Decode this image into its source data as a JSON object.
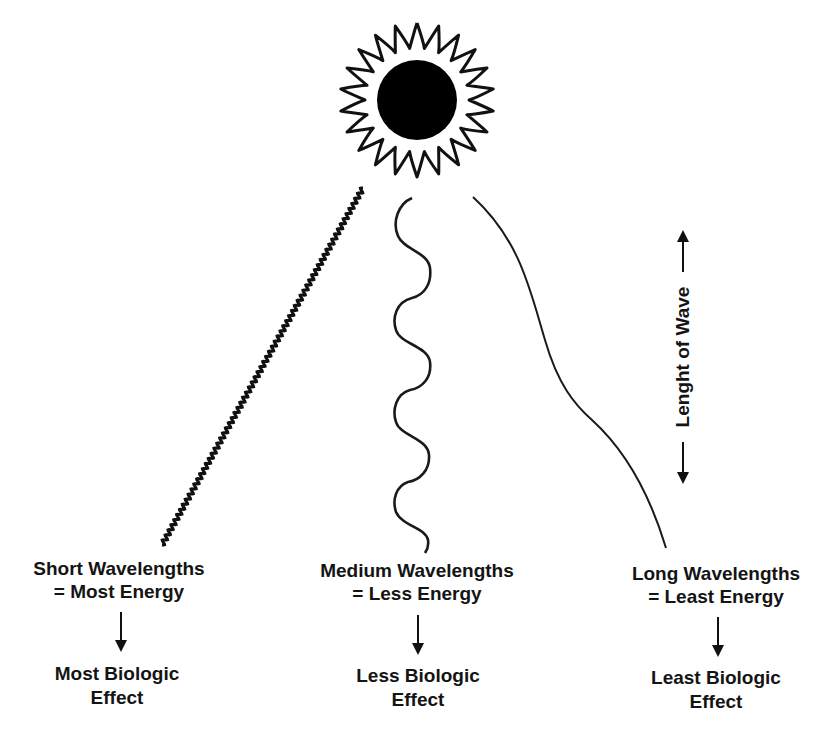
{
  "diagram": {
    "title": "",
    "sun": {
      "icon": "sun-icon",
      "disc_color": "#000000",
      "ray_style": "wavy-outline"
    },
    "axis": {
      "label": "Lenght of Wave",
      "arrow": "double-vertical-arrow"
    },
    "columns": [
      {
        "id": "short",
        "wave_type": "short-wavelength-wave",
        "line1": "Short Wavelengths",
        "line2": "= Most Energy",
        "effect_line1": "Most Biologic",
        "effect_line2": "Effect"
      },
      {
        "id": "medium",
        "wave_type": "medium-wavelength-wave",
        "line1": "Medium Wavelengths",
        "line2": "= Less Energy",
        "effect_line1": "Less Biologic",
        "effect_line2": "Effect"
      },
      {
        "id": "long",
        "wave_type": "long-wavelength-wave",
        "line1": "Long Wavelengths",
        "line2": "= Least Energy",
        "effect_line1": "Least Biologic",
        "effect_line2": "Effect"
      }
    ],
    "colors": {
      "ink": "#111111",
      "background": "#ffffff"
    }
  }
}
